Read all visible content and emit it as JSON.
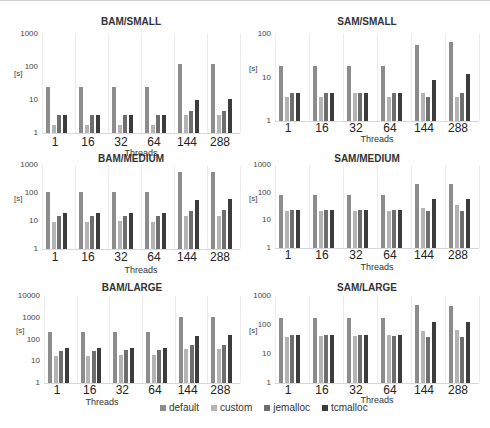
{
  "legend": [
    {
      "name": "default",
      "color": "#8c8c8c"
    },
    {
      "name": "custom",
      "color": "#b4b4b4"
    },
    {
      "name": "jemalloc",
      "color": "#6e6e6e"
    },
    {
      "name": "tcmalloc",
      "color": "#3c3c3c"
    }
  ],
  "chart_data": [
    {
      "type": "bar",
      "title": "BAM/SMALL",
      "xlabel": "Threads",
      "ylabel": "[s]",
      "yscale": "log",
      "ylim": [
        1,
        1000
      ],
      "yticks": [
        "1",
        "10",
        "100",
        "1000"
      ],
      "categories": [
        "1",
        "16",
        "32",
        "64",
        "144",
        "288"
      ],
      "series": [
        {
          "name": "default",
          "values": [
            25,
            25,
            25,
            25,
            120,
            125
          ]
        },
        {
          "name": "custom",
          "values": [
            1.8,
            1.8,
            1.8,
            1.8,
            3.5,
            3.5
          ]
        },
        {
          "name": "jemalloc",
          "values": [
            3.5,
            3.5,
            3.5,
            3.5,
            4.5,
            4.5
          ]
        },
        {
          "name": "tcmalloc",
          "values": [
            3.5,
            3.5,
            3.5,
            3.5,
            10,
            11
          ]
        }
      ]
    },
    {
      "type": "bar",
      "title": "SAM/SMALL",
      "xlabel": "Threads",
      "ylabel": "[s]",
      "yscale": "log",
      "ylim": [
        1,
        100
      ],
      "yticks": [
        "1",
        "10",
        "100"
      ],
      "categories": [
        "1",
        "16",
        "32",
        "64",
        "144",
        "288"
      ],
      "series": [
        {
          "name": "default",
          "values": [
            18,
            18,
            18,
            18,
            55,
            65
          ]
        },
        {
          "name": "custom",
          "values": [
            3.5,
            3.5,
            4.5,
            3.5,
            4.5,
            3.5
          ]
        },
        {
          "name": "jemalloc",
          "values": [
            4.5,
            4.5,
            4.5,
            4.5,
            3.5,
            4.5
          ]
        },
        {
          "name": "tcmalloc",
          "values": [
            4.5,
            4.5,
            4.5,
            4.5,
            9,
            12
          ]
        }
      ]
    },
    {
      "type": "bar",
      "title": "BAM/MEDIUM",
      "xlabel": "Threads",
      "ylabel": "[s]",
      "yscale": "log",
      "ylim": [
        1,
        1000
      ],
      "yticks": [
        "1",
        "10",
        "100",
        "1000"
      ],
      "categories": [
        "1",
        "16",
        "32",
        "64",
        "144",
        "288"
      ],
      "series": [
        {
          "name": "default",
          "values": [
            105,
            105,
            105,
            105,
            550,
            550
          ]
        },
        {
          "name": "custom",
          "values": [
            9,
            9,
            10,
            9,
            15,
            15
          ]
        },
        {
          "name": "jemalloc",
          "values": [
            15,
            15,
            15,
            15,
            22,
            25
          ]
        },
        {
          "name": "tcmalloc",
          "values": [
            20,
            20,
            20,
            20,
            55,
            60
          ]
        }
      ]
    },
    {
      "type": "bar",
      "title": "SAM/MEDIUM",
      "xlabel": "Threads",
      "ylabel": "[s]",
      "yscale": "log",
      "ylim": [
        1,
        1000
      ],
      "yticks": [
        "1",
        "10",
        "100",
        "1000"
      ],
      "categories": [
        "1",
        "16",
        "32",
        "64",
        "144",
        "288"
      ],
      "series": [
        {
          "name": "default",
          "values": [
            85,
            85,
            85,
            85,
            200,
            210
          ]
        },
        {
          "name": "custom",
          "values": [
            22,
            22,
            22,
            22,
            28,
            35
          ]
        },
        {
          "name": "jemalloc",
          "values": [
            23,
            23,
            23,
            23,
            22,
            22
          ]
        },
        {
          "name": "tcmalloc",
          "values": [
            23,
            23,
            24,
            23,
            60,
            60
          ]
        }
      ]
    },
    {
      "type": "bar",
      "title": "BAM/LARGE",
      "xlabel": "Threads",
      "ylabel": "[s]",
      "yscale": "log",
      "ylim": [
        1,
        10000
      ],
      "yticks": [
        "1",
        "10",
        "100",
        "1000",
        "10000"
      ],
      "categories": [
        "1",
        "16",
        "32",
        "64",
        "144",
        "288"
      ],
      "series": [
        {
          "name": "default",
          "values": [
            230,
            230,
            230,
            230,
            1100,
            1100
          ]
        },
        {
          "name": "custom",
          "values": [
            18,
            18,
            20,
            20,
            35,
            38
          ]
        },
        {
          "name": "jemalloc",
          "values": [
            30,
            30,
            32,
            33,
            55,
            55
          ]
        },
        {
          "name": "tcmalloc",
          "values": [
            40,
            40,
            40,
            40,
            150,
            160
          ]
        }
      ]
    },
    {
      "type": "bar",
      "title": "SAM/LARGE",
      "xlabel": "Threads",
      "ylabel": "[s]",
      "yscale": "log",
      "ylim": [
        1,
        1000
      ],
      "yticks": [
        "1",
        "10",
        "100",
        "1000"
      ],
      "categories": [
        "1",
        "16",
        "32",
        "64",
        "144",
        "288"
      ],
      "series": [
        {
          "name": "default",
          "values": [
            170,
            170,
            170,
            170,
            480,
            460
          ]
        },
        {
          "name": "custom",
          "values": [
            40,
            42,
            42,
            45,
            60,
            65
          ]
        },
        {
          "name": "jemalloc",
          "values": [
            45,
            45,
            45,
            42,
            40,
            40
          ]
        },
        {
          "name": "tcmalloc",
          "values": [
            45,
            45,
            45,
            45,
            130,
            130
          ]
        }
      ]
    }
  ],
  "layout": [
    {
      "left": 0,
      "top": 16,
      "titleTop": 0,
      "plotLeft": 42,
      "plotTop": 18,
      "plotW": 198,
      "plotH": 99,
      "xtickTop": 119,
      "xlabTop": 132
    },
    {
      "left": 245,
      "top": 16,
      "titleTop": 0,
      "plotLeft": 30,
      "plotTop": 18,
      "plotW": 204,
      "plotH": 87,
      "xtickTop": 105,
      "xlabTop": 118
    },
    {
      "left": 0,
      "top": 153,
      "titleTop": 0,
      "plotLeft": 42,
      "plotTop": 12,
      "plotW": 198,
      "plotH": 84,
      "xtickTop": 97,
      "xlabTop": 112
    },
    {
      "left": 245,
      "top": 153,
      "titleTop": 0,
      "plotLeft": 30,
      "plotTop": 12,
      "plotW": 204,
      "plotH": 83,
      "xtickTop": 95,
      "xlabTop": 109
    },
    {
      "left": 0,
      "top": 282,
      "titleTop": 0,
      "plotLeft": 44,
      "plotTop": 14,
      "plotW": 196,
      "plotH": 87,
      "xtickTop": 101,
      "xlabTop": 115
    },
    {
      "left": 245,
      "top": 282,
      "titleTop": 0,
      "plotLeft": 30,
      "plotTop": 14,
      "plotW": 204,
      "plotH": 87,
      "xtickTop": 101,
      "xlabTop": 113
    }
  ]
}
